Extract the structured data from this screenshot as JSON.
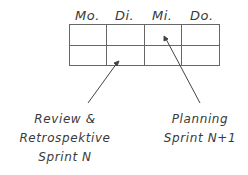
{
  "diagram": {
    "days": [
      "Mo.",
      "Di.",
      "Mi.",
      "Do."
    ],
    "grid": {
      "rows": 2,
      "columns": 4
    },
    "annotations": [
      {
        "text_lines": [
          "Review &",
          "Retrospektive",
          "Sprint N"
        ],
        "points_to": "Di. row 2"
      },
      {
        "text_lines": [
          "Planning",
          "Sprint N+1"
        ],
        "points_to": "Mi. row 1"
      }
    ],
    "colors": {
      "line": "#555555",
      "text": "#3a3a3a",
      "background": "#ffffff"
    }
  }
}
